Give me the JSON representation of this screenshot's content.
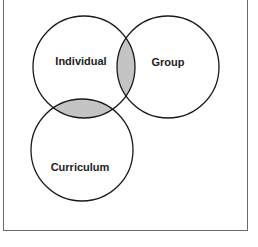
{
  "diagram": {
    "type": "venn",
    "circles": [
      {
        "id": "individual",
        "label": "Individual",
        "cx": 84,
        "cy": 67,
        "r": 51
      },
      {
        "id": "group",
        "label": "Group",
        "cx": 168,
        "cy": 67,
        "r": 51
      },
      {
        "id": "curriculum",
        "label": "Curriculum",
        "cx": 82,
        "cy": 150,
        "r": 51
      }
    ],
    "shaded_intersections": [
      "individual-group",
      "individual-curriculum"
    ],
    "colors": {
      "stroke": "#1a1a1a",
      "shade": "#c4c4c4",
      "border": "#6a6a6a",
      "text": "#1e1e1e"
    }
  }
}
